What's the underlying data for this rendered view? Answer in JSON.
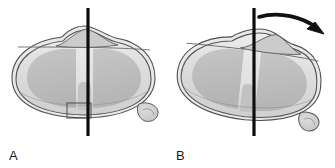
{
  "figure": {
    "background_color": "#ffffff",
    "width": 335,
    "height": 168,
    "panel_count": 2
  },
  "colors": {
    "outline": "#4f4f4f",
    "outline_dark": "#3a3a3a",
    "axis_line": "#0d0d0d",
    "arrow": "#111111",
    "body_fill_light": "#e6e6e6",
    "body_fill_mid": "#d2d2d2",
    "lobe_fill": "#bfbfbf",
    "lobe_fill_dark": "#b2b2b2",
    "channel_fill": "#e2e2e2",
    "nodule_fill": "#cfcfcf",
    "hump_fill": "#c9c9c9",
    "label_color": "#1a1a1a",
    "detail_box_stroke": "#555555",
    "background": "#ffffff"
  },
  "panels": [
    {
      "id": "a",
      "label": "A",
      "state": "neutral",
      "description": "Capsule-shaped body shown in neutral, non-rotated position with vertical midline axis",
      "axis": {
        "name": "vertical-axis-line",
        "orientation": "vertical",
        "x": 88,
        "y_top": 8,
        "y_bottom": 136,
        "stroke_width": 3.2,
        "color": "#0d0d0d"
      },
      "body": {
        "shape": "rounded-capsule",
        "center_x": 83,
        "center_y": 77,
        "rx": 73,
        "ry": 40,
        "rotation_deg": 0,
        "double_outline": true
      },
      "hump": {
        "name": "superior-hump",
        "center_x": 86,
        "peak_y": 29,
        "width": 62,
        "offset": "centered"
      },
      "lobes": [
        {
          "name": "left-lobe",
          "side": "left"
        },
        {
          "name": "right-lobe",
          "side": "right"
        }
      ],
      "central_channel": {
        "name": "central-channel",
        "present": true,
        "x": 83,
        "width": 14
      },
      "nodule": {
        "name": "inferior-right-nodule",
        "center_x": 149,
        "center_y": 113,
        "rx": 11,
        "ry": 9
      },
      "detail_box": {
        "name": "detail-region-box",
        "present": true,
        "x": 67,
        "y": 103,
        "width": 24,
        "height": 15
      },
      "arrow": {
        "present": false
      }
    },
    {
      "id": "b",
      "label": "B",
      "state": "rotated",
      "description": "Same body rotated clockwise about the vertical axis, indicated by a curved arrow above",
      "axis": {
        "name": "vertical-axis-line",
        "orientation": "vertical",
        "x": 87,
        "y_top": 8,
        "y_bottom": 136,
        "stroke_width": 3.2,
        "color": "#0d0d0d"
      },
      "body": {
        "shape": "rounded-capsule",
        "center_x": 80,
        "center_y": 80,
        "rx": 72,
        "ry": 40,
        "rotation_deg": 6,
        "double_outline": true
      },
      "hump": {
        "name": "superior-hump",
        "center_x": 103,
        "peak_y": 33,
        "width": 58,
        "offset": "shifted-right"
      },
      "lobes": [
        {
          "name": "left-lobe",
          "side": "left"
        },
        {
          "name": "right-lobe",
          "side": "right"
        }
      ],
      "central_channel": {
        "name": "central-channel",
        "present": true,
        "x": 81,
        "width": 14
      },
      "nodule": {
        "name": "inferior-right-nodule",
        "center_x": 145,
        "center_y": 118,
        "rx": 11,
        "ry": 9
      },
      "detail_box": {
        "present": false
      },
      "arrow": {
        "name": "rotation-arrow",
        "present": true,
        "type": "curved",
        "direction": "clockwise-rightward",
        "start_x": 92,
        "start_y": 17,
        "end_x": 152,
        "end_y": 31,
        "color": "#111111"
      }
    }
  ]
}
